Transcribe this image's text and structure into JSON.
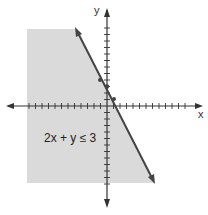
{
  "figure": {
    "inequality_label": "2x + y ≤ 3",
    "x_axis_label": "x",
    "y_axis_label": "y",
    "boundary_line": "2x + y = 3",
    "shaded_side": "below-left",
    "colors": {
      "shade": "#dadada",
      "axis": "#333333",
      "line": "#444444"
    }
  }
}
